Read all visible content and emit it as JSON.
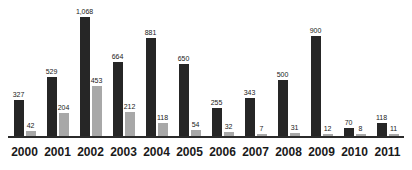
{
  "chart_data": {
    "type": "bar",
    "title": "",
    "subtitle": "",
    "xlabel": "",
    "ylabel": "",
    "grid": false,
    "legend": "none",
    "y_axis_visible": false,
    "ylim": [
      0,
      1068
    ],
    "categories": [
      "2000",
      "2001",
      "2002",
      "2003",
      "2004",
      "2005",
      "2006",
      "2007",
      "2008",
      "2009",
      "2010",
      "2011"
    ],
    "series": [
      {
        "name": "dark-series",
        "color": "#262626",
        "values": [
          327,
          529,
          1068,
          664,
          881,
          650,
          255,
          343,
          500,
          900,
          70,
          118
        ],
        "labels": [
          "327",
          "529",
          "1,068",
          "664",
          "881",
          "650",
          "255",
          "343",
          "500",
          "900",
          "70",
          "118"
        ]
      },
      {
        "name": "light-series",
        "color": "#a8a8a8",
        "values": [
          42,
          204,
          453,
          212,
          118,
          54,
          32,
          7,
          31,
          12,
          8,
          11
        ],
        "labels": [
          "42",
          "204",
          "453",
          "212",
          "118",
          "54",
          "32",
          "7",
          "31",
          "12",
          "8",
          "11"
        ]
      }
    ]
  },
  "axis": {
    "baseline_color": "#2b2b2b"
  }
}
